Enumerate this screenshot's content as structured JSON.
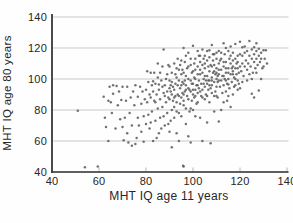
{
  "chart_data": {
    "type": "scatter",
    "title": "",
    "xlabel": "MHT IQ age 11 years",
    "ylabel": "MHT IQ age 80 years",
    "xlim": [
      40,
      140
    ],
    "ylim": [
      40,
      140
    ],
    "x_tick_values": [
      40,
      60,
      80,
      100,
      120,
      140
    ],
    "y_tick_values": [
      40,
      60,
      80,
      100,
      120,
      140
    ],
    "grid": "horizontal",
    "legend": "none",
    "point_color": "#5f5f5f",
    "grid_color": "#c9c9c9",
    "axis_color": "#2b2b2b",
    "tick_mark_color": "#b8b8b8",
    "points": [
      [
        51,
        79.5
      ],
      [
        54,
        43
      ],
      [
        59.5,
        43.5
      ],
      [
        96,
        43.5
      ],
      [
        95.8,
        44
      ],
      [
        91,
        56
      ],
      [
        99,
        59
      ],
      [
        104,
        60
      ],
      [
        107.5,
        58.5
      ],
      [
        111,
        72.5
      ],
      [
        96,
        120
      ],
      [
        100,
        121.5
      ],
      [
        108,
        122
      ],
      [
        113,
        123
      ],
      [
        116,
        121
      ],
      [
        118,
        122.5
      ],
      [
        120,
        124
      ],
      [
        121,
        120.5
      ],
      [
        122,
        121
      ],
      [
        124,
        124.5
      ],
      [
        126,
        120.5
      ],
      [
        127,
        123
      ],
      [
        128,
        119.5
      ],
      [
        130,
        118.5
      ],
      [
        125,
        90.5
      ],
      [
        128,
        92.5
      ],
      [
        126,
        88
      ],
      [
        130,
        108
      ],
      [
        129,
        113
      ],
      [
        130.5,
        113
      ],
      [
        131,
        118.5
      ],
      [
        131.5,
        110
      ],
      [
        62,
        88.5
      ],
      [
        62.5,
        75
      ],
      [
        63,
        69
      ],
      [
        64,
        60
      ],
      [
        64,
        86
      ],
      [
        64.5,
        95
      ],
      [
        65,
        85
      ],
      [
        65.5,
        78
      ],
      [
        66,
        90.5
      ],
      [
        66,
        96
      ],
      [
        67,
        68
      ],
      [
        67.5,
        95.5
      ],
      [
        68,
        83
      ],
      [
        68.5,
        92
      ],
      [
        69,
        74
      ],
      [
        69.5,
        86.5
      ],
      [
        70,
        95
      ],
      [
        70,
        69
      ],
      [
        70.5,
        60.5
      ],
      [
        71,
        75
      ],
      [
        71.5,
        86
      ],
      [
        72,
        95
      ],
      [
        72,
        65
      ],
      [
        72.5,
        59
      ],
      [
        73,
        78
      ],
      [
        73.5,
        88
      ],
      [
        74,
        57
      ],
      [
        74,
        70
      ],
      [
        74.5,
        92
      ],
      [
        75,
        83
      ],
      [
        75.5,
        58
      ],
      [
        75.5,
        96
      ],
      [
        76,
        62
      ],
      [
        76.5,
        75
      ],
      [
        76.5,
        88.5
      ],
      [
        77,
        70
      ],
      [
        77.5,
        95
      ],
      [
        78,
        66
      ],
      [
        78,
        84
      ],
      [
        78.5,
        92
      ],
      [
        79,
        76
      ],
      [
        79,
        59.5
      ],
      [
        79.5,
        87
      ],
      [
        80,
        71
      ],
      [
        80,
        93
      ],
      [
        80.5,
        85
      ],
      [
        80.5,
        105
      ],
      [
        81,
        77
      ],
      [
        81,
        98
      ],
      [
        81.5,
        68
      ],
      [
        81.5,
        90
      ],
      [
        82,
        88
      ],
      [
        82,
        104
      ],
      [
        82,
        72
      ],
      [
        82.5,
        79
      ],
      [
        82.5,
        96
      ],
      [
        83,
        92
      ],
      [
        83,
        60
      ],
      [
        83,
        98.5
      ],
      [
        83.5,
        86
      ],
      [
        83.5,
        104
      ],
      [
        84,
        97
      ],
      [
        84,
        73
      ],
      [
        84,
        85
      ],
      [
        84.5,
        90
      ],
      [
        84.5,
        62
      ],
      [
        85,
        81
      ],
      [
        85,
        101
      ],
      [
        85,
        110
      ],
      [
        85.5,
        65
      ],
      [
        85.5,
        93
      ],
      [
        85.5,
        96.5
      ],
      [
        86,
        87
      ],
      [
        86,
        75
      ],
      [
        86,
        104
      ],
      [
        86.5,
        99
      ],
      [
        86.5,
        68
      ],
      [
        87,
        82
      ],
      [
        87,
        108
      ],
      [
        87,
        95
      ],
      [
        87.5,
        91
      ],
      [
        87.5,
        76
      ],
      [
        87.5,
        119
      ],
      [
        88,
        70
      ],
      [
        88,
        96
      ],
      [
        88,
        89
      ],
      [
        88.5,
        85
      ],
      [
        88.5,
        100
      ],
      [
        89,
        78
      ],
      [
        89,
        103
      ],
      [
        89,
        92
      ],
      [
        89.5,
        88
      ],
      [
        89.5,
        71
      ],
      [
        89.5,
        109
      ],
      [
        90,
        94
      ],
      [
        90,
        87
      ],
      [
        90,
        99
      ],
      [
        90,
        108
      ],
      [
        90,
        66
      ],
      [
        90.5,
        92
      ],
      [
        90.5,
        73
      ],
      [
        90.5,
        96
      ],
      [
        91,
        80
      ],
      [
        91,
        104
      ],
      [
        91,
        98
      ],
      [
        91,
        90
      ],
      [
        91.5,
        95
      ],
      [
        91.5,
        86
      ],
      [
        92,
        88
      ],
      [
        92,
        75
      ],
      [
        92,
        110
      ],
      [
        92,
        93
      ],
      [
        92,
        82
      ],
      [
        92.5,
        97
      ],
      [
        92.5,
        103
      ],
      [
        92.5,
        89
      ],
      [
        93,
        85
      ],
      [
        93,
        101
      ],
      [
        93,
        107
      ],
      [
        93,
        79
      ],
      [
        93,
        65
      ],
      [
        93.5,
        90
      ],
      [
        93.5,
        96
      ],
      [
        93.5,
        113
      ],
      [
        94,
        78
      ],
      [
        94,
        106
      ],
      [
        94,
        99
      ],
      [
        94,
        89
      ],
      [
        94,
        60
      ],
      [
        94.5,
        94
      ],
      [
        94.5,
        84
      ],
      [
        94.5,
        109
      ],
      [
        95,
        88
      ],
      [
        95,
        112
      ],
      [
        95,
        76
      ],
      [
        95,
        103
      ],
      [
        95,
        96
      ],
      [
        95.5,
        98
      ],
      [
        95.5,
        91
      ],
      [
        95.5,
        106
      ],
      [
        96,
        83
      ],
      [
        96,
        104
      ],
      [
        96,
        97
      ],
      [
        96,
        86
      ],
      [
        96,
        90
      ],
      [
        96.5,
        92
      ],
      [
        96.5,
        111
      ],
      [
        96.5,
        99
      ],
      [
        97,
        96
      ],
      [
        97,
        71
      ],
      [
        97,
        102
      ],
      [
        97,
        115
      ],
      [
        97,
        81
      ],
      [
        97,
        93
      ],
      [
        97.5,
        107
      ],
      [
        97.5,
        89
      ],
      [
        98,
        87
      ],
      [
        98,
        100
      ],
      [
        98,
        94
      ],
      [
        98,
        108
      ],
      [
        98,
        117
      ],
      [
        98,
        63
      ],
      [
        98.5,
        93
      ],
      [
        98.5,
        79
      ],
      [
        99,
        109
      ],
      [
        99,
        81
      ],
      [
        99,
        92
      ],
      [
        99,
        113
      ],
      [
        99,
        99
      ],
      [
        99.5,
        97
      ],
      [
        99.5,
        104
      ],
      [
        99.5,
        86
      ],
      [
        100,
        90
      ],
      [
        100,
        97
      ],
      [
        100,
        105
      ],
      [
        100,
        80
      ],
      [
        100,
        93
      ],
      [
        100.5,
        88
      ],
      [
        100.5,
        110
      ],
      [
        100.5,
        101
      ],
      [
        101,
        100
      ],
      [
        101,
        93
      ],
      [
        101,
        113
      ],
      [
        101,
        106
      ],
      [
        101,
        76
      ],
      [
        101,
        89
      ],
      [
        101.5,
        96
      ],
      [
        101.5,
        84
      ],
      [
        102,
        103
      ],
      [
        102,
        85
      ],
      [
        102,
        108
      ],
      [
        102,
        96
      ],
      [
        102,
        118
      ],
      [
        102,
        91
      ],
      [
        102.5,
        99
      ],
      [
        102.5,
        115
      ],
      [
        102.5,
        94
      ],
      [
        103,
        92
      ],
      [
        103,
        111
      ],
      [
        103,
        103
      ],
      [
        103,
        75
      ],
      [
        103,
        106
      ],
      [
        103,
        115
      ],
      [
        103.5,
        97
      ],
      [
        103.5,
        89
      ],
      [
        104,
        104
      ],
      [
        104,
        88
      ],
      [
        104,
        93
      ],
      [
        104,
        119
      ],
      [
        104,
        109
      ],
      [
        104.5,
        100
      ],
      [
        104.5,
        113
      ],
      [
        104.5,
        97
      ],
      [
        105,
        95
      ],
      [
        105,
        115
      ],
      [
        105,
        107
      ],
      [
        105,
        87
      ],
      [
        105,
        110
      ],
      [
        105,
        102
      ],
      [
        105.5,
        90
      ],
      [
        105.5,
        99
      ],
      [
        106,
        102
      ],
      [
        106,
        97
      ],
      [
        106,
        118
      ],
      [
        106,
        112
      ],
      [
        106,
        72
      ],
      [
        106,
        89
      ],
      [
        106.5,
        93
      ],
      [
        106.5,
        108
      ],
      [
        106.5,
        99
      ],
      [
        107,
        105
      ],
      [
        107,
        99
      ],
      [
        107,
        85
      ],
      [
        107,
        114
      ],
      [
        107,
        118.5
      ],
      [
        107,
        96
      ],
      [
        107.5,
        109
      ],
      [
        107.5,
        94
      ],
      [
        108,
        96
      ],
      [
        108,
        101
      ],
      [
        108,
        91
      ],
      [
        108,
        108
      ],
      [
        108,
        99
      ],
      [
        108.5,
        112
      ],
      [
        108.5,
        104
      ],
      [
        108.5,
        116
      ],
      [
        109,
        98
      ],
      [
        109,
        89
      ],
      [
        109,
        116
      ],
      [
        109,
        109
      ],
      [
        109,
        79
      ],
      [
        109,
        105
      ],
      [
        109.5,
        103
      ],
      [
        109.5,
        92
      ],
      [
        110,
        95
      ],
      [
        110,
        107
      ],
      [
        110,
        100
      ],
      [
        110,
        113
      ],
      [
        110,
        104
      ],
      [
        110,
        89
      ],
      [
        110,
        117
      ],
      [
        110.5,
        98
      ],
      [
        110.5,
        88
      ],
      [
        110.5,
        102
      ],
      [
        111,
        103
      ],
      [
        111,
        110
      ],
      [
        111,
        106
      ],
      [
        111,
        118
      ],
      [
        111,
        99
      ],
      [
        111.5,
        95
      ],
      [
        111.5,
        112
      ],
      [
        112,
        106
      ],
      [
        112,
        99
      ],
      [
        112,
        117
      ],
      [
        112,
        113
      ],
      [
        112,
        80
      ],
      [
        112.5,
        102
      ],
      [
        112.5,
        91
      ],
      [
        113,
        96
      ],
      [
        113,
        108
      ],
      [
        113,
        102
      ],
      [
        113,
        85
      ],
      [
        113,
        111
      ],
      [
        113.5,
        100
      ],
      [
        113.5,
        116
      ],
      [
        114,
        92
      ],
      [
        114,
        111
      ],
      [
        114,
        104
      ],
      [
        114,
        107
      ],
      [
        114,
        120
      ],
      [
        114,
        99
      ],
      [
        114.5,
        97
      ],
      [
        114.5,
        86
      ],
      [
        115,
        107
      ],
      [
        115,
        100
      ],
      [
        115,
        118
      ],
      [
        115,
        89
      ],
      [
        115,
        104
      ],
      [
        115,
        96.5
      ],
      [
        115.5,
        94
      ],
      [
        115.5,
        113
      ],
      [
        116,
        103
      ],
      [
        116,
        110
      ],
      [
        116,
        115
      ],
      [
        116,
        82
      ],
      [
        116.5,
        98
      ],
      [
        116.5,
        107
      ],
      [
        117,
        105
      ],
      [
        117,
        112
      ],
      [
        117,
        90
      ],
      [
        117,
        108
      ],
      [
        117,
        117
      ],
      [
        117,
        103
      ],
      [
        117.5,
        101
      ],
      [
        117.5,
        95
      ],
      [
        118,
        96
      ],
      [
        118,
        107
      ],
      [
        118,
        100
      ],
      [
        118,
        113
      ],
      [
        118.5,
        110
      ],
      [
        118.5,
        103
      ],
      [
        119,
        99
      ],
      [
        119,
        115
      ],
      [
        119,
        93
      ],
      [
        119,
        111
      ],
      [
        119,
        107
      ],
      [
        119.5,
        104
      ],
      [
        119.5,
        97
      ],
      [
        120,
        108
      ],
      [
        120,
        94
      ],
      [
        120,
        116
      ],
      [
        120.5,
        105
      ],
      [
        121,
        110
      ],
      [
        121,
        115
      ],
      [
        121,
        98
      ],
      [
        121.5,
        102
      ],
      [
        122,
        108
      ],
      [
        122,
        117
      ],
      [
        122.5,
        112
      ],
      [
        123,
        106
      ],
      [
        123,
        118
      ],
      [
        123,
        99
      ],
      [
        123.5,
        110
      ],
      [
        124,
        103
      ],
      [
        124,
        115
      ],
      [
        124.5,
        108
      ],
      [
        125,
        113
      ],
      [
        125,
        119
      ],
      [
        125,
        100
      ],
      [
        125.5,
        104
      ],
      [
        126,
        111
      ],
      [
        126,
        116
      ],
      [
        126.5,
        107
      ],
      [
        127,
        113
      ],
      [
        127,
        118
      ],
      [
        127,
        104
      ],
      [
        127.5,
        109
      ],
      [
        128,
        115
      ],
      [
        128.5,
        111
      ],
      [
        129,
        117
      ],
      [
        129,
        100
      ],
      [
        129.5,
        107
      ]
    ]
  }
}
